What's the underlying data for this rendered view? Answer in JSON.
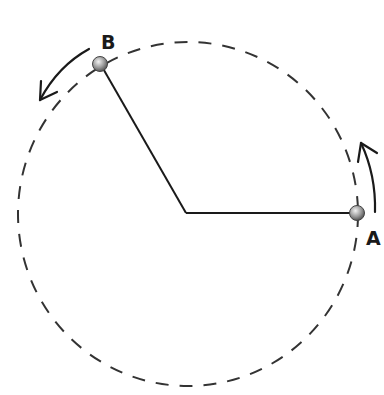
{
  "diagram": {
    "type": "circular-motion",
    "circle": {
      "cx": 188,
      "cy": 214,
      "rx": 170,
      "ry": 172,
      "style": "dashed",
      "color": "#333333"
    },
    "center": {
      "x": 186,
      "y": 213
    },
    "points": [
      {
        "label": "A",
        "x": 357,
        "y": 213
      },
      {
        "label": "B",
        "x": 100,
        "y": 64
      }
    ],
    "arrows": [
      {
        "near": "A",
        "direction": "counterclockwise"
      },
      {
        "near": "B",
        "direction": "counterclockwise"
      }
    ],
    "colors": {
      "line": "#1a1a1a",
      "point": "#9a9a9a"
    }
  }
}
